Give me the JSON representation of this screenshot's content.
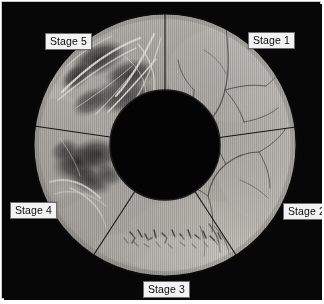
{
  "figure": {
    "background_color": "#070707",
    "frame_color": "#c9c9c9",
    "label_background": "#f2f2f2",
    "label_text_color": "#0b0b0b",
    "label_border_color": "#6e6e6e"
  },
  "ring": {
    "center_x": 161,
    "center_y": 141,
    "outer_radius": 131,
    "inner_radius": 55,
    "inner_fill": "#040404",
    "sector_divider_color": "#1a1a1a",
    "sector_count": 5
  },
  "labels": {
    "stage1": "Stage 1",
    "stage2": "Stage 2",
    "stage3": "Stage 3",
    "stage4": "Stage 4",
    "stage5": "Stage 5"
  },
  "sectors": [
    {
      "id": "stage1",
      "label": "Stage 1",
      "start_angle": -90,
      "end_angle": -8,
      "tone": "#b9b6b0",
      "lesion": "none"
    },
    {
      "id": "stage2",
      "label": "Stage 2",
      "start_angle": -8,
      "end_angle": 61,
      "tone": "#c2bfb9",
      "lesion": "none"
    },
    {
      "id": "stage3",
      "label": "Stage 3",
      "start_angle": 61,
      "end_angle": 118,
      "tone": "#c6c3bd",
      "lesion": "speckled"
    },
    {
      "id": "stage4",
      "label": "Stage 4",
      "start_angle": 118,
      "end_angle": 183,
      "tone": "#b0ada7",
      "lesion": "dark-patch"
    },
    {
      "id": "stage5",
      "label": "Stage 5",
      "start_angle": 183,
      "end_angle": 270,
      "tone": "#a8a5a0",
      "lesion": "dark-patch-with-fibrous-bands"
    }
  ]
}
